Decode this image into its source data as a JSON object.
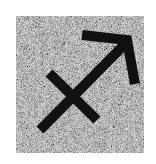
{
  "symbol": {
    "name": "Sagittarius",
    "glyph": "♐",
    "icon": "sagittarius-icon",
    "stroke_color": "#111111"
  },
  "tile": {
    "texture": "gray-noise",
    "base_color": "#8a8a8a",
    "light_speckle": "#c8c8c8",
    "dark_speckle": "#4a4a4a"
  },
  "background_color": "#ffffff"
}
